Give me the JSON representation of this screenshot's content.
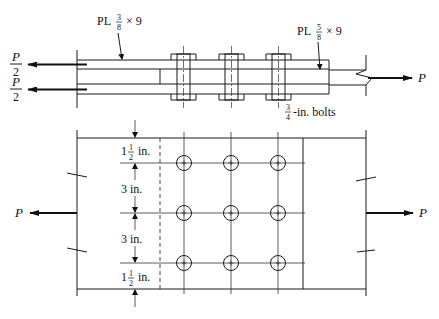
{
  "figure": {
    "type": "bolted lap splice connection",
    "elevation_view": {
      "outer_plate_label": {
        "prefix": "PL",
        "num": "3",
        "den": "8",
        "suffix": "× 9"
      },
      "inner_plate_label": {
        "prefix": "PL",
        "num": "5",
        "den": "8",
        "suffix": "× 9"
      },
      "bolt_label": {
        "num": "3",
        "den": "4",
        "suffix": "-in. bolts"
      },
      "left_loads": [
        {
          "symbol": "P",
          "den": "2"
        },
        {
          "symbol": "P",
          "den": "2"
        }
      ],
      "right_load": "P",
      "bolt_count": 3
    },
    "plan_view": {
      "left_load": "P",
      "right_load": "P",
      "bolt_rows": 3,
      "bolt_columns": 3,
      "dimensions": [
        {
          "whole": "1",
          "num": "1",
          "den": "2",
          "unit": "in."
        },
        {
          "text": "3 in."
        },
        {
          "text": "3 in."
        },
        {
          "whole": "1",
          "num": "1",
          "den": "2",
          "unit": "in."
        }
      ]
    }
  }
}
